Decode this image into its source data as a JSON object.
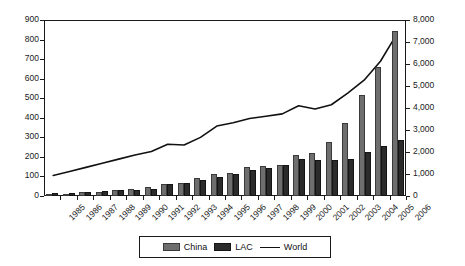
{
  "chart_data": {
    "type": "bar",
    "title": "",
    "xlabel": "",
    "ylabel": "",
    "categories": [
      "1985",
      "1986",
      "1987",
      "1988",
      "1989",
      "1990",
      "1991",
      "1992",
      "1993",
      "1994",
      "1995",
      "1996",
      "1997",
      "1998",
      "1999",
      "2000",
      "2001",
      "2002",
      "2003",
      "2004",
      "2005",
      "2006"
    ],
    "left_axis": {
      "ylim": [
        0,
        900
      ],
      "ticks": [
        0,
        100,
        200,
        300,
        400,
        500,
        600,
        700,
        800,
        900
      ],
      "tick_labels": [
        "0",
        "100",
        "200",
        "300",
        "400",
        "500",
        "600",
        "700",
        "800",
        "900"
      ],
      "applies_to": [
        "China",
        "LAC"
      ]
    },
    "right_axis": {
      "ylim": [
        0,
        8000
      ],
      "ticks": [
        0,
        1000,
        2000,
        3000,
        4000,
        5000,
        6000,
        7000,
        8000
      ],
      "tick_labels": [
        "0",
        "1,000",
        "2,000",
        "3,000",
        "4,000",
        "5,000",
        "6,000",
        "7,000",
        "8,000"
      ],
      "applies_to": [
        "World"
      ]
    },
    "grid": false,
    "legend_position": "bottom",
    "series": [
      {
        "name": "China",
        "kind": "bar",
        "axis": "left",
        "color": "#6e6e6e",
        "values": [
          8,
          12,
          20,
          22,
          30,
          37,
          45,
          60,
          68,
          93,
          115,
          120,
          147,
          151,
          160,
          208,
          222,
          278,
          375,
          515,
          660,
          845
        ]
      },
      {
        "name": "LAC",
        "kind": "bar",
        "axis": "left",
        "color": "#2b2b2b",
        "values": [
          13,
          15,
          21,
          24,
          31,
          32,
          37,
          62,
          69,
          83,
          97,
          112,
          131,
          142,
          157,
          190,
          186,
          184,
          191,
          224,
          256,
          288
        ]
      },
      {
        "name": "World",
        "kind": "line",
        "axis": "right",
        "color": "#111111",
        "values": [
          900,
          1080,
          1270,
          1460,
          1650,
          1840,
          2000,
          2330,
          2300,
          2650,
          3170,
          3320,
          3520,
          3620,
          3730,
          4100,
          3950,
          4150,
          4680,
          5280,
          6150,
          7400
        ]
      }
    ]
  },
  "legend": {
    "items": [
      {
        "label": "China",
        "marker": "swatch-light"
      },
      {
        "label": "LAC",
        "marker": "swatch-dark"
      },
      {
        "label": "World",
        "marker": "line"
      }
    ]
  }
}
